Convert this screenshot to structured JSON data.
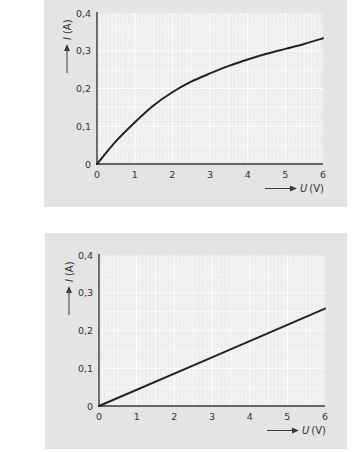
{
  "chart_data": [
    {
      "type": "line",
      "title": "",
      "xlabel": "U (V)",
      "ylabel": "I (A)",
      "x_symbol": "U",
      "x_unit": "(V)",
      "y_symbol": "I",
      "y_unit": "(A)",
      "xlim": [
        0,
        6
      ],
      "ylim": [
        0,
        0.4
      ],
      "grid": true,
      "x_ticks": [
        "0",
        "1",
        "2",
        "3",
        "4",
        "5",
        "6"
      ],
      "y_ticks": [
        "0",
        "0,1",
        "0,2",
        "0,3",
        "0,4"
      ],
      "series": [
        {
          "name": "nonlinear characteristic",
          "x": [
            0,
            0.5,
            1,
            1.5,
            2,
            2.5,
            3,
            3.5,
            4,
            4.5,
            5,
            5.5,
            6
          ],
          "values": [
            0,
            0.06,
            0.11,
            0.155,
            0.19,
            0.218,
            0.24,
            0.26,
            0.277,
            0.292,
            0.305,
            0.318,
            0.333
          ]
        }
      ]
    },
    {
      "type": "line",
      "title": "",
      "xlabel": "U (V)",
      "ylabel": "I (A)",
      "x_symbol": "U",
      "x_unit": "(V)",
      "y_symbol": "I",
      "y_unit": "(A)",
      "xlim": [
        0,
        6
      ],
      "ylim": [
        0,
        0.4
      ],
      "grid": true,
      "x_ticks": [
        "0",
        "1",
        "2",
        "3",
        "4",
        "5",
        "6"
      ],
      "y_ticks": [
        "0",
        "0,1",
        "0,2",
        "0,3",
        "0,4"
      ],
      "series": [
        {
          "name": "linear characteristic",
          "x": [
            0,
            6
          ],
          "values": [
            0,
            0.258
          ]
        }
      ]
    }
  ],
  "colors": {
    "panel": "#e4e4e4",
    "plot_bg": "#e9e9e9",
    "grid": "#ffffff",
    "axis": "#3a3a3a",
    "curve": "#222222",
    "text": "#333333"
  }
}
